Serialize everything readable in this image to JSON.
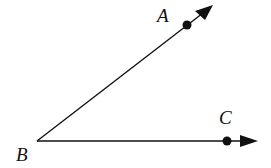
{
  "diagram": {
    "type": "angle",
    "vertex": {
      "label": "B",
      "x": 37,
      "y": 141
    },
    "rays": [
      {
        "name": "ray-BA",
        "point": {
          "label": "A",
          "x": 187,
          "y": 25
        },
        "tip": {
          "x": 213,
          "y": 5
        }
      },
      {
        "name": "ray-BC",
        "point": {
          "label": "C",
          "x": 227,
          "y": 141
        },
        "tip": {
          "x": 258,
          "y": 141
        }
      }
    ],
    "labels": {
      "A": "A",
      "B": "B",
      "C": "C"
    },
    "color": "#111111"
  }
}
